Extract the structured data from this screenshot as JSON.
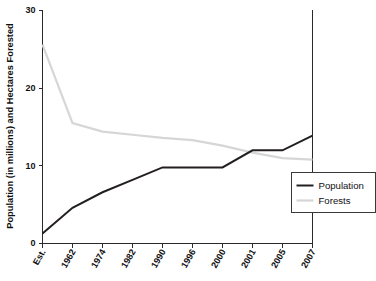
{
  "chart_data": {
    "type": "line",
    "title": "",
    "xlabel": "",
    "ylabel": "Population (in millions) and Hectares Forested",
    "categories": [
      "Est.",
      "1962",
      "1974",
      "1982",
      "1990",
      "1996",
      "2000",
      "2001",
      "2005",
      "2007"
    ],
    "ylim": [
      0,
      30
    ],
    "yticks": [
      0,
      10,
      20,
      30
    ],
    "ytick_labels": [
      "0",
      "10",
      "20",
      "30"
    ],
    "grid": false,
    "legend_position": "bottom-right",
    "series": [
      {
        "name": "Population",
        "color": "#231f20",
        "values": [
          1.3,
          4.6,
          6.6,
          8.2,
          9.8,
          9.8,
          9.8,
          12.0,
          12.0,
          13.9
        ]
      },
      {
        "name": "Forests",
        "color": "#d6d6d6",
        "values": [
          25.6,
          15.5,
          14.4,
          14.0,
          13.6,
          13.3,
          12.6,
          11.7,
          11.0,
          10.8
        ]
      }
    ]
  },
  "legend": {
    "entries": [
      {
        "label": "Population"
      },
      {
        "label": "Forests"
      }
    ]
  },
  "colors": {
    "population": "#231f20",
    "forests": "#d6d6d6",
    "axis": "#2a2a2a",
    "text": "#111111",
    "background": "#ffffff"
  }
}
